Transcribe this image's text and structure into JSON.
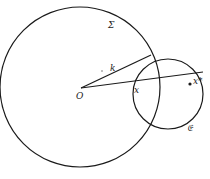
{
  "diagram": {
    "labels": {
      "sigma": "Σ",
      "k": "k",
      "origin": "O",
      "x": "x",
      "x_star": "x*",
      "small_circle": "𝔈"
    },
    "elements": {
      "big_circle": {
        "cx": 80,
        "cy": 87,
        "r": 80
      },
      "small_circle": {
        "cx": 168,
        "cy": 94,
        "r": 35
      },
      "point_dot": {
        "cx": 190,
        "cy": 84
      }
    },
    "stroke_color": "#1a1a1a"
  }
}
